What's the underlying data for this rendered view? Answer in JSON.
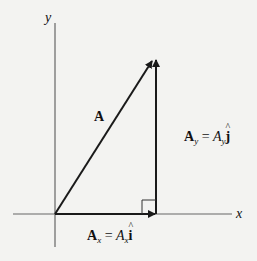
{
  "diagram": {
    "axes": {
      "x_label": "x",
      "y_label": "y"
    },
    "vector": {
      "label": "A"
    },
    "x_component": {
      "bold": "A",
      "bold_sub": "x",
      "equals": " = ",
      "scalar": "A",
      "scalar_sub": "x",
      "unit": "i"
    },
    "y_component": {
      "bold": "A",
      "bold_sub": "y",
      "equals": " = ",
      "scalar": "A",
      "scalar_sub": "y",
      "unit": "j"
    },
    "colors": {
      "line": "#1a1a1a",
      "axis": "#555555",
      "background": "#f3f3f1"
    }
  }
}
